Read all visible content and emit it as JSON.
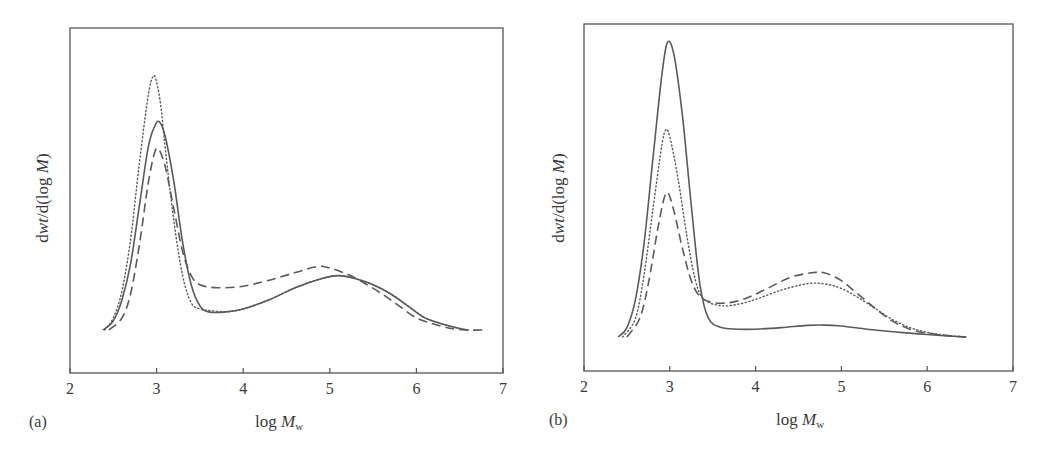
{
  "chart_data": [
    {
      "panel": "(a)",
      "type": "line",
      "title": "",
      "xlabel": "log M_w",
      "ylabel": "dwt/d(log M)",
      "xlim": [
        2,
        7
      ],
      "xticks": [
        2,
        3,
        4,
        5,
        6,
        7
      ],
      "ylim": [
        0,
        100
      ],
      "y_units": "arbitrary (relative, no y tick labels)",
      "grid": false,
      "legend": "none",
      "series": [
        {
          "name": "solid",
          "style": "solid",
          "x": [
            2.38,
            2.5,
            2.6,
            2.7,
            2.8,
            2.9,
            2.97,
            3.03,
            3.1,
            3.2,
            3.3,
            3.4,
            3.5,
            3.6,
            3.8,
            4.0,
            4.3,
            4.6,
            4.9,
            5.1,
            5.3,
            5.5,
            5.7,
            5.9,
            6.1,
            6.3,
            6.5,
            6.6
          ],
          "y": [
            0,
            3,
            10,
            22,
            41,
            60,
            67,
            69,
            64,
            49,
            29,
            15,
            8,
            6,
            6,
            7,
            10,
            14,
            17,
            18,
            17,
            15,
            12,
            8,
            4,
            2,
            0.5,
            0
          ]
        },
        {
          "name": "dotted",
          "style": "dotted",
          "x": [
            2.4,
            2.5,
            2.6,
            2.7,
            2.8,
            2.9,
            2.96,
            3.0,
            3.05,
            3.1,
            3.2,
            3.3,
            3.4,
            3.5,
            3.6,
            3.8,
            4.0,
            4.3,
            4.6,
            4.9,
            5.1,
            5.3,
            5.5,
            5.7,
            5.9,
            6.1,
            6.3,
            6.5,
            6.6
          ],
          "y": [
            0,
            4,
            13,
            30,
            55,
            77,
            84,
            82,
            74,
            60,
            36,
            18,
            9,
            7,
            6.5,
            6,
            7,
            10,
            14,
            17,
            18,
            17,
            15,
            12,
            8,
            4,
            2,
            0.5,
            0
          ]
        },
        {
          "name": "dashed",
          "style": "dashed",
          "x": [
            2.45,
            2.6,
            2.7,
            2.8,
            2.9,
            2.97,
            3.02,
            3.1,
            3.2,
            3.3,
            3.4,
            3.5,
            3.7,
            4.0,
            4.3,
            4.6,
            4.85,
            5.0,
            5.2,
            5.4,
            5.6,
            5.8,
            6.0,
            6.2,
            6.4,
            6.6,
            6.82
          ],
          "y": [
            0,
            4,
            12,
            28,
            48,
            58,
            60,
            54,
            40,
            26,
            18,
            15,
            14,
            14.5,
            16.5,
            19,
            21,
            20.5,
            18.5,
            15.5,
            12,
            8,
            4,
            2,
            0.5,
            0,
            0
          ]
        }
      ]
    },
    {
      "panel": "(b)",
      "type": "line",
      "title": "",
      "xlabel": "log M_w",
      "ylabel": "dwt/d(log M)",
      "xlim": [
        2,
        7
      ],
      "xticks": [
        2,
        3,
        4,
        5,
        6,
        7
      ],
      "ylim": [
        0,
        100
      ],
      "y_units": "arbitrary (relative, no y tick labels)",
      "grid": false,
      "legend": "none",
      "series": [
        {
          "name": "solid",
          "style": "solid",
          "x": [
            2.4,
            2.5,
            2.6,
            2.7,
            2.8,
            2.9,
            2.97,
            3.05,
            3.15,
            3.25,
            3.35,
            3.45,
            3.6,
            3.8,
            4.0,
            4.3,
            4.6,
            4.8,
            5.0,
            5.3,
            5.6,
            5.9,
            6.2,
            6.45
          ],
          "y": [
            0,
            3,
            12,
            30,
            56,
            82,
            94,
            90,
            70,
            42,
            17,
            6,
            3,
            2.5,
            2.5,
            3,
            3.7,
            3.8,
            3.5,
            2.5,
            1.7,
            1.0,
            0.4,
            0
          ]
        },
        {
          "name": "dotted",
          "style": "dotted",
          "x": [
            2.45,
            2.6,
            2.7,
            2.8,
            2.9,
            2.95,
            3.0,
            3.1,
            3.2,
            3.3,
            3.4,
            3.6,
            3.8,
            4.0,
            4.3,
            4.6,
            4.8,
            5.0,
            5.2,
            5.4,
            5.6,
            5.8,
            6.0,
            6.2,
            6.45
          ],
          "y": [
            0,
            6,
            20,
            40,
            60,
            66,
            64,
            50,
            32,
            18,
            12,
            10,
            10.5,
            12,
            15,
            17,
            17,
            15.5,
            12.5,
            9,
            5.5,
            3,
            1.5,
            0.6,
            0
          ]
        },
        {
          "name": "dashed",
          "style": "dashed",
          "x": [
            2.5,
            2.65,
            2.75,
            2.85,
            2.93,
            2.98,
            3.05,
            3.15,
            3.25,
            3.35,
            3.5,
            3.7,
            3.9,
            4.1,
            4.4,
            4.65,
            4.8,
            5.0,
            5.2,
            5.4,
            5.6,
            5.8,
            6.0,
            6.2,
            6.45
          ],
          "y": [
            0,
            6,
            17,
            33,
            44,
            46,
            40,
            28,
            18,
            13,
            11,
            11,
            12.5,
            15,
            19,
            20.5,
            20.5,
            18,
            13.5,
            9,
            5,
            2.5,
            1.2,
            0.5,
            0
          ]
        }
      ]
    }
  ],
  "panels": {
    "a": {
      "tag": "(a)",
      "ylabel_main": "d",
      "ylabel_italic": "wt",
      "ylabel_mid": "/d(log ",
      "ylabel_italic2": "M",
      "ylabel_end": ")",
      "xlabel_main": "log ",
      "xlabel_italic": "M",
      "xlabel_sub": "w",
      "ticks": [
        "2",
        "3",
        "4",
        "5",
        "6",
        "7"
      ]
    },
    "b": {
      "tag": "(b)",
      "ylabel_main": "d",
      "ylabel_italic": "wt",
      "ylabel_mid": "/d(log ",
      "ylabel_italic2": "M",
      "ylabel_end": ")",
      "xlabel_main": "log ",
      "xlabel_italic": "M",
      "xlabel_sub": "w",
      "ticks": [
        "2",
        "3",
        "4",
        "5",
        "6",
        "7"
      ]
    }
  },
  "colors": {
    "axis": "#555555",
    "line": "#5a5a5a",
    "text": "#3a3a3a"
  }
}
